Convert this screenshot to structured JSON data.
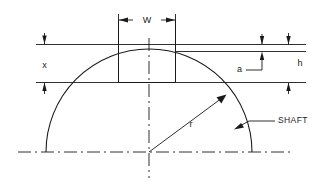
{
  "drawing": {
    "title": "Shaft keyway dimension diagram",
    "line_color": "#1a1a1a",
    "background_color": "#ffffff",
    "dimensions": [
      {
        "key": "w",
        "label": "W",
        "meaning": "keyway width",
        "orientation": "horizontal",
        "position": "top"
      },
      {
        "key": "x",
        "label": "x",
        "meaning": "keyway depth from top surface",
        "orientation": "vertical",
        "position": "left"
      },
      {
        "key": "a",
        "label": "a",
        "meaning": "small offset at shaft crown",
        "orientation": "vertical",
        "position": "right-inner"
      },
      {
        "key": "h",
        "label": "h",
        "meaning": "overall height to keyway bottom",
        "orientation": "vertical",
        "position": "right-outer"
      },
      {
        "key": "r",
        "label": "r",
        "meaning": "shaft radius",
        "orientation": "radial",
        "position": "center"
      }
    ],
    "callouts": [
      {
        "key": "shaft",
        "label": "SHAFT",
        "points_to": "shaft outer arc"
      }
    ],
    "geometry": {
      "center_x": 149,
      "center_y": 152,
      "radius": 103,
      "keyway_left_x": 118,
      "keyway_right_x": 175,
      "top_line_y": 44,
      "offset_line_y": 51,
      "keyway_bottom_y": 82,
      "baseline_y": 152
    }
  },
  "labels": {
    "w": "W",
    "x": "x",
    "a": "a",
    "h": "h",
    "r": "r",
    "shaft": "SHAFT"
  }
}
